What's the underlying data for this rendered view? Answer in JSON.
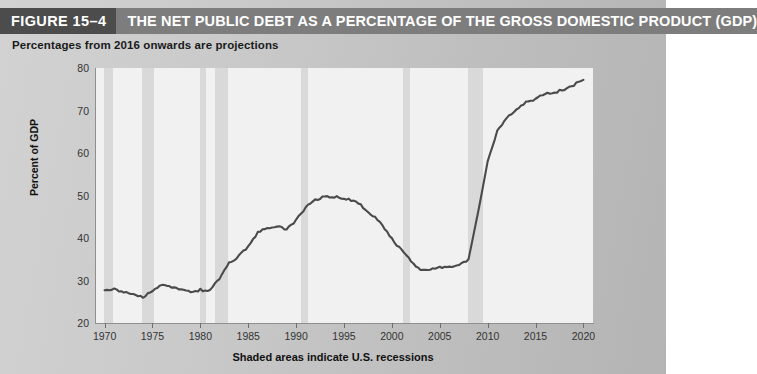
{
  "header": {
    "figure_number": "FIGURE 15–4",
    "title": "THE NET PUBLIC DEBT AS A PERCENTAGE OF THE GROSS DOMESTIC PRODUCT (GDP)",
    "number_bg": "#4c4c4c",
    "title_bg": "#7d7d7d"
  },
  "subtitle": "Percentages from 2016 onwards are projections",
  "chart_data": {
    "type": "line",
    "title": "THE NET PUBLIC DEBT AS A PERCENTAGE OF THE GROSS DOMESTIC PRODUCT (GDP)",
    "subtitle": "Percentages from 2016 onwards are projections",
    "xlabel": "",
    "ylabel": "Percent of GDP",
    "caption": "Shaded areas indicate U.S. recessions",
    "xlim": [
      1969,
      2021
    ],
    "ylim": [
      20,
      80
    ],
    "yticks": [
      20,
      30,
      40,
      50,
      60,
      70,
      80
    ],
    "xticks": [
      1970,
      1975,
      1980,
      1985,
      1990,
      1995,
      2000,
      2005,
      2010,
      2015,
      2020
    ],
    "grid": false,
    "legend": "none",
    "line_color": "#4a4a4a",
    "plot_bg": "#f1f1f1",
    "recession_band_color": "#d9d9d9",
    "recession_bands": [
      {
        "start": 1969.9,
        "end": 1970.9
      },
      {
        "start": 1973.9,
        "end": 1975.2
      },
      {
        "start": 1980.0,
        "end": 1980.6
      },
      {
        "start": 1981.5,
        "end": 1982.9
      },
      {
        "start": 1990.5,
        "end": 1991.2
      },
      {
        "start": 2001.2,
        "end": 2001.9
      },
      {
        "start": 2007.9,
        "end": 2009.5
      }
    ],
    "x": [
      1970,
      1971,
      1972,
      1973,
      1974,
      1975,
      1976,
      1977,
      1978,
      1979,
      1980,
      1981,
      1982,
      1983,
      1984,
      1985,
      1986,
      1987,
      1988,
      1989,
      1990,
      1991,
      1992,
      1993,
      1994,
      1995,
      1996,
      1997,
      1998,
      1999,
      2000,
      2001,
      2002,
      2003,
      2004,
      2005,
      2006,
      2007,
      2008,
      2009,
      2010,
      2011,
      2012,
      2013,
      2014,
      2015,
      2016,
      2017,
      2018,
      2019,
      2020
    ],
    "values": [
      28.0,
      27.9,
      27.4,
      26.8,
      26.0,
      27.5,
      28.9,
      28.5,
      28.0,
      27.2,
      27.8,
      27.6,
      30.5,
      34.0,
      35.7,
      38.1,
      41.2,
      42.4,
      42.6,
      42.1,
      44.2,
      47.2,
      49.0,
      49.8,
      49.7,
      49.3,
      48.8,
      47.3,
      45.3,
      43.1,
      39.7,
      37.2,
      34.6,
      32.5,
      32.7,
      33.2,
      33.0,
      33.4,
      35.0,
      46.0,
      58.0,
      65.0,
      68.3,
      70.4,
      72.0,
      72.6,
      74.0,
      74.2,
      75.0,
      76.0,
      77.2
    ],
    "series_name": "Net public debt as a percentage of GDP"
  }
}
